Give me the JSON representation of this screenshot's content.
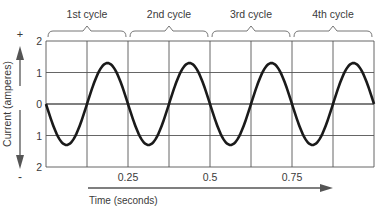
{
  "chart_data": {
    "type": "line",
    "title": "",
    "xlabel": "Time (seconds)",
    "ylabel": "Current (amperes)",
    "y_positive_label": "+",
    "y_negative_label": "-",
    "xlim": [
      0,
      1.0
    ],
    "ylim": [
      -2,
      2
    ],
    "x_ticks": [
      0.25,
      0.5,
      0.75
    ],
    "x_tick_labels": [
      "0.25",
      "0.5",
      "0.75"
    ],
    "y_ticks": [
      2,
      1,
      0,
      -1,
      -2
    ],
    "y_tick_labels": [
      "2",
      "1",
      "0",
      "1",
      "2"
    ],
    "grid": true,
    "grid_x_step": 0.125,
    "grid_y_step": 1,
    "series": [
      {
        "name": "Alternating current",
        "function": "sine",
        "amplitude": 1.3,
        "frequency_hz": 4,
        "phase": "starts at 0 going negative",
        "x": [
          0,
          0.0625,
          0.125,
          0.1875,
          0.25,
          0.3125,
          0.375,
          0.4375,
          0.5,
          0.5625,
          0.625,
          0.6875,
          0.75,
          0.8125,
          0.875,
          0.9375,
          1.0
        ],
        "y": [
          0,
          -1.3,
          0,
          1.3,
          0,
          -1.3,
          0,
          1.3,
          0,
          -1.3,
          0,
          1.3,
          0,
          -1.3,
          0,
          1.3,
          0
        ]
      }
    ],
    "annotations": [
      {
        "label": "1st cycle",
        "x_range": [
          0,
          0.25
        ]
      },
      {
        "label": "2nd cycle",
        "x_range": [
          0.25,
          0.5
        ]
      },
      {
        "label": "3rd cycle",
        "x_range": [
          0.5,
          0.75
        ]
      },
      {
        "label": "4th cycle",
        "x_range": [
          0.75,
          1.0
        ]
      }
    ],
    "colors": {
      "curve": "#1a1a1a",
      "grid": "#555555",
      "text": "#3a3a3a"
    }
  }
}
